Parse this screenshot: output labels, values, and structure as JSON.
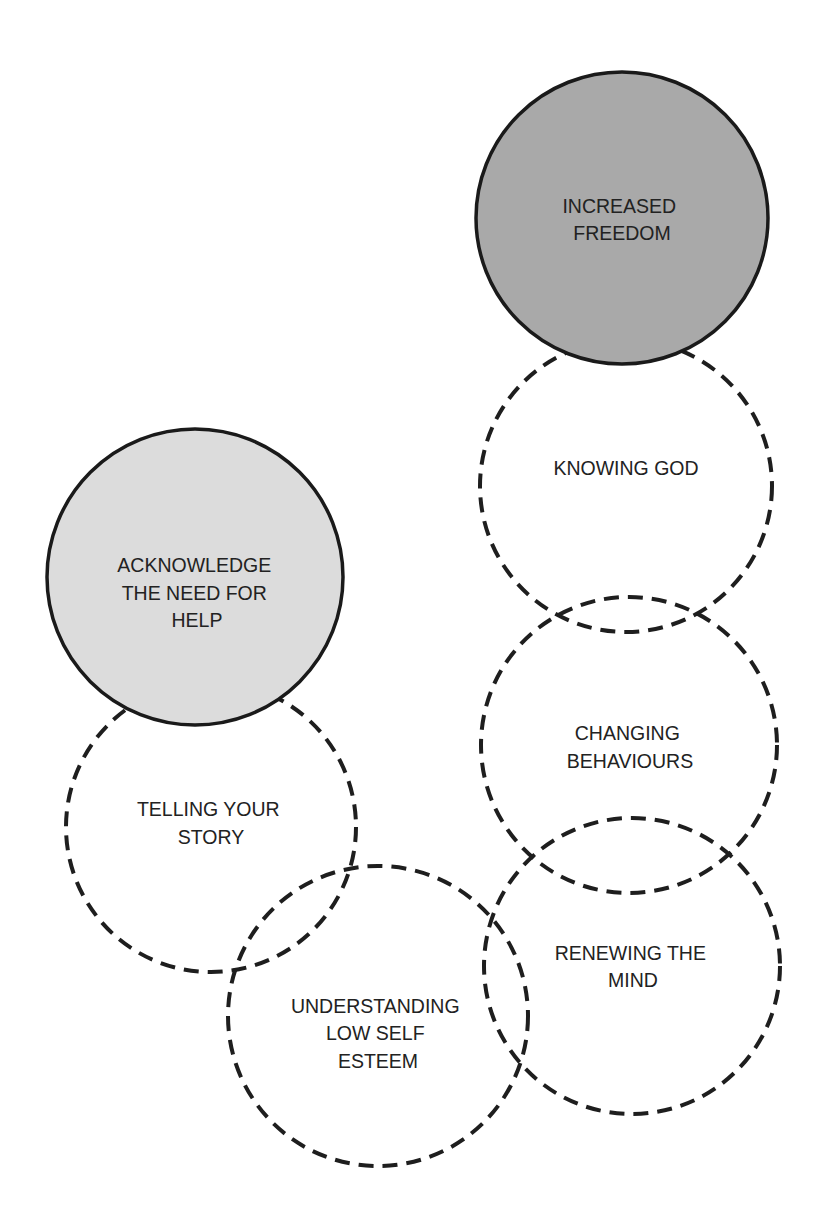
{
  "diagram": {
    "type": "overlapping-circle-pathway",
    "colors": {
      "stroke": "#1e1e1e",
      "goal_fill": "#a9a9a9",
      "start_fill": "#dcdcdc",
      "text": "#222222",
      "background": "#ffffff"
    },
    "nodes": [
      {
        "id": "increased-freedom",
        "role": "goal",
        "style": "solid",
        "cx": 622,
        "cy": 218,
        "r": 146,
        "lines": [
          "INCREASED",
          "FREEDOM"
        ]
      },
      {
        "id": "knowing-god",
        "role": "step",
        "style": "dashed",
        "cx": 626,
        "cy": 486,
        "r": 146,
        "lines": [
          "KNOWING GOD"
        ]
      },
      {
        "id": "changing-behaviours",
        "role": "step",
        "style": "dashed",
        "cx": 629,
        "cy": 745,
        "r": 148,
        "lines": [
          "CHANGING",
          "BEHAVIOURS"
        ]
      },
      {
        "id": "renewing-the-mind",
        "role": "step",
        "style": "dashed",
        "cx": 632,
        "cy": 966,
        "r": 148,
        "lines": [
          "RENEWING THE",
          "MIND"
        ]
      },
      {
        "id": "acknowledge-the-need-for-help",
        "role": "start",
        "style": "solid",
        "cx": 195,
        "cy": 577,
        "r": 148,
        "lines": [
          "ACKNOWLEDGE",
          "THE NEED FOR",
          "HELP"
        ]
      },
      {
        "id": "telling-your-story",
        "role": "step",
        "style": "dashed",
        "cx": 211,
        "cy": 827,
        "r": 145,
        "lines": [
          "TELLING YOUR",
          "STORY"
        ]
      },
      {
        "id": "understanding-low-self-esteem",
        "role": "step",
        "style": "dashed",
        "cx": 378,
        "cy": 1016,
        "r": 150,
        "lines": [
          "UNDERSTANDING",
          "LOW SELF",
          "ESTEEM"
        ]
      }
    ]
  }
}
